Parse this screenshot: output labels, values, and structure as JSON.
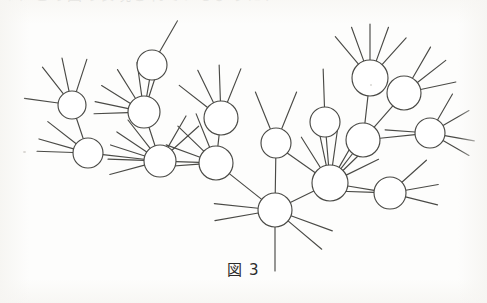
{
  "figure": {
    "caption": "図 3",
    "caption_label": "figure-3",
    "top_text_clipped": "）、この図の表現されているように、",
    "stroke_color": "#4a4a46",
    "background_color": "#fdfdfc",
    "node_fill": "#ffffff",
    "node_radius": 13,
    "stroke_width": 1.15
  },
  "graph": {
    "type": "undirected-tree",
    "node_count": 16,
    "nodes": [
      {
        "id": "n1",
        "name": "node-left-upper",
        "cx": 72,
        "cy": 105,
        "r": 14
      },
      {
        "id": "n2",
        "name": "node-left-lower",
        "cx": 88,
        "cy": 153,
        "r": 15
      },
      {
        "id": "n3",
        "name": "node-upper-leaf-a",
        "cx": 152,
        "cy": 65,
        "r": 15
      },
      {
        "id": "n4",
        "name": "node-mid-left-upper",
        "cx": 144,
        "cy": 112,
        "r": 16
      },
      {
        "id": "n5",
        "name": "node-mid-left-hub",
        "cx": 160,
        "cy": 161,
        "r": 16
      },
      {
        "id": "n6",
        "name": "node-mid-upper",
        "cx": 221,
        "cy": 118,
        "r": 17
      },
      {
        "id": "n7",
        "name": "node-mid-hub",
        "cx": 216,
        "cy": 163,
        "r": 17
      },
      {
        "id": "n8",
        "name": "node-center-upper",
        "cx": 276,
        "cy": 143,
        "r": 15
      },
      {
        "id": "n9",
        "name": "node-center-hub",
        "cx": 275,
        "cy": 210,
        "r": 17
      },
      {
        "id": "n10",
        "name": "node-right-upper-leaf",
        "cx": 325,
        "cy": 122,
        "r": 15
      },
      {
        "id": "n11",
        "name": "node-right-hub",
        "cx": 330,
        "cy": 183,
        "r": 18
      },
      {
        "id": "n12",
        "name": "node-top-right-star",
        "cx": 370,
        "cy": 78,
        "r": 18
      },
      {
        "id": "n13",
        "name": "node-top-right-b",
        "cx": 404,
        "cy": 93,
        "r": 17
      },
      {
        "id": "n14",
        "name": "node-right-mid",
        "cx": 363,
        "cy": 140,
        "r": 17
      },
      {
        "id": "n15",
        "name": "node-far-right",
        "cx": 430,
        "cy": 133,
        "r": 15
      },
      {
        "id": "n16",
        "name": "node-right-lower",
        "cx": 390,
        "cy": 193,
        "r": 16
      }
    ],
    "edges": [
      {
        "from": "n1",
        "to": "n2"
      },
      {
        "from": "n2",
        "to": "n5"
      },
      {
        "from": "n3",
        "to": "n4"
      },
      {
        "from": "n4",
        "to": "n5"
      },
      {
        "from": "n5",
        "to": "n7"
      },
      {
        "from": "n6",
        "to": "n7"
      },
      {
        "from": "n7",
        "to": "n9"
      },
      {
        "from": "n8",
        "to": "n9"
      },
      {
        "from": "n9",
        "to": "n11"
      },
      {
        "from": "n10",
        "to": "n11"
      },
      {
        "from": "n11",
        "to": "n14"
      },
      {
        "from": "n11",
        "to": "n16"
      },
      {
        "from": "n12",
        "to": "n14"
      },
      {
        "from": "n13",
        "to": "n14"
      },
      {
        "from": "n14",
        "to": "n15"
      }
    ],
    "stubs": [
      {
        "node": "n1",
        "angles": [
          188,
          232,
          258,
          288
        ],
        "len": 34
      },
      {
        "node": "n2",
        "angles": [
          182,
          196,
          218
        ],
        "len": 36
      },
      {
        "node": "n3",
        "angles": [
          300
        ],
        "len": 36
      },
      {
        "node": "n4",
        "angles": [
          178,
          192,
          212,
          238,
          262,
          288
        ],
        "len": 34
      },
      {
        "node": "n5",
        "angles": [
          165,
          182,
          198,
          214,
          232,
          300,
          318
        ],
        "len": 36
      },
      {
        "node": "n6",
        "angles": [
          218,
          244,
          268,
          292
        ],
        "len": 36
      },
      {
        "node": "n7",
        "angles": [
          176,
          200,
          224,
          248
        ],
        "len": 36
      },
      {
        "node": "n8",
        "angles": [
          248,
          292
        ],
        "len": 40
      },
      {
        "node": "n9",
        "angles": [
          170,
          186,
          20,
          40,
          90
        ],
        "len": 44
      },
      {
        "node": "n10",
        "angles": [
          268
        ],
        "len": 38
      },
      {
        "node": "n11",
        "angles": [
          215,
          238,
          258,
          278,
          300,
          316,
          334
        ],
        "len": 36
      },
      {
        "node": "n12",
        "angles": [
          230,
          250,
          270,
          290,
          312
        ],
        "len": 36
      },
      {
        "node": "n13",
        "angles": [
          300,
          322,
          348
        ],
        "len": 36
      },
      {
        "node": "n15",
        "angles": [
          300,
          330,
          10,
          30,
          184
        ],
        "len": 30
      },
      {
        "node": "n16",
        "angles": [
          318,
          350,
          14,
          182
        ],
        "len": 33
      }
    ]
  }
}
